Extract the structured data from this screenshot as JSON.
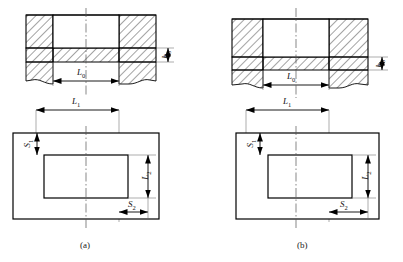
{
  "figure": {
    "type": "engineering-drawing",
    "panels": [
      {
        "id": "a",
        "caption": "(a)",
        "elevation": {
          "view": "section",
          "hatching": "45-degree-diagonal",
          "dimensions": [
            {
              "name": "L0",
              "label": "L",
              "sub": "0",
              "orientation": "horizontal",
              "position": "below-cavity"
            },
            {
              "name": "h0",
              "label": "h",
              "sub": "0",
              "orientation": "vertical",
              "position": "right-edge"
            }
          ]
        },
        "plan": {
          "view": "top",
          "dimensions": [
            {
              "name": "L1",
              "label": "L",
              "sub": "1",
              "orientation": "horizontal",
              "position": "top"
            },
            {
              "name": "L2",
              "label": "L",
              "sub": "2",
              "orientation": "vertical",
              "position": "right"
            },
            {
              "name": "S1",
              "label": "S",
              "sub": "1",
              "orientation": "vertical",
              "position": "upper-left"
            },
            {
              "name": "S2",
              "label": "S",
              "sub": "2",
              "orientation": "horizontal",
              "position": "bottom-right"
            }
          ]
        }
      },
      {
        "id": "b",
        "caption": "(b)",
        "elevation": {
          "view": "section",
          "hatching": "45-degree-diagonal",
          "dimensions": [
            {
              "name": "L0",
              "label": "L",
              "sub": "0",
              "orientation": "horizontal",
              "position": "below-cavity"
            },
            {
              "name": "h0",
              "label": "h",
              "sub": "0",
              "orientation": "vertical",
              "position": "right-edge"
            }
          ]
        },
        "plan": {
          "view": "top",
          "dimensions": [
            {
              "name": "L1",
              "label": "L",
              "sub": "1",
              "orientation": "horizontal",
              "position": "top"
            },
            {
              "name": "L2",
              "label": "L",
              "sub": "2",
              "orientation": "vertical",
              "position": "right"
            },
            {
              "name": "S1",
              "label": "S",
              "sub": "1",
              "orientation": "vertical",
              "position": "upper-left"
            },
            {
              "name": "S2",
              "label": "S",
              "sub": "2",
              "orientation": "horizontal",
              "position": "bottom-right"
            }
          ]
        }
      }
    ],
    "labels": {
      "L0": "L",
      "L0_sub": "0",
      "L1": "L",
      "L1_sub": "1",
      "L2": "L",
      "L2_sub": "2",
      "S1": "S",
      "S1_sub": "1",
      "S2": "S",
      "S2_sub": "2",
      "h0": "h",
      "h0_sub": "0",
      "caption_a": "(a)",
      "caption_b": "(b)"
    },
    "colors": {
      "line": "#000000",
      "hatch": "#333333",
      "centerline": "#555555",
      "thin": "#777777",
      "background": "#ffffff"
    }
  }
}
